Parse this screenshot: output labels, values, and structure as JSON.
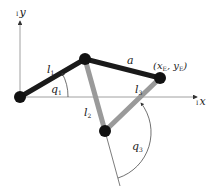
{
  "diagram": {
    "axes": {
      "x_label": "x",
      "x_prefix": "I",
      "y_label": "y",
      "y_prefix": "I"
    },
    "links": {
      "l1": "l",
      "l1_sub": "1",
      "l2": "l",
      "l2_sub": "2",
      "l3": "l",
      "l3_sub": "3",
      "a": "a"
    },
    "angles": {
      "q1": "q",
      "q1_sub": "1",
      "q3": "q",
      "q3_sub": "3"
    },
    "end_effector": {
      "label_open": "(x",
      "x_sub": "E",
      "sep": ", y",
      "y_sub": "E",
      "label_close": ")"
    },
    "colors": {
      "link_dark": "#1a1a1a",
      "link_gray": "#9a9a9a",
      "axis": "#777777",
      "joint": "#111111"
    }
  }
}
